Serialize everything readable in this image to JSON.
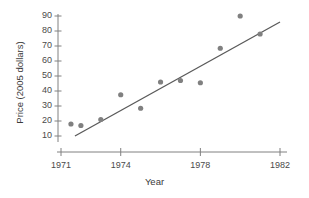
{
  "chart_data": {
    "type": "scatter",
    "title": "",
    "xlabel": "Year",
    "ylabel": "Price (2005 dollars)",
    "xlim": [
      1971,
      1982
    ],
    "ylim": [
      10,
      90
    ],
    "grid": false,
    "legend": false,
    "x_ticks": [
      1971,
      1974,
      1978,
      1982
    ],
    "x_tick_labels": [
      "1971",
      "1974",
      "1978",
      "1982"
    ],
    "y_ticks": [
      10,
      20,
      30,
      40,
      50,
      60,
      70,
      80,
      90
    ],
    "y_tick_labels": [
      "10",
      "20",
      "30",
      "40",
      "50",
      "60",
      "70",
      "80",
      "90"
    ],
    "marker_color": "#808080",
    "line_color": "#5a5a5a",
    "axis_color": "#808080",
    "points": [
      {
        "x": 1971.5,
        "y": 18
      },
      {
        "x": 1972.0,
        "y": 17
      },
      {
        "x": 1973.0,
        "y": 21
      },
      {
        "x": 1974.0,
        "y": 37.5
      },
      {
        "x": 1975.0,
        "y": 28.5
      },
      {
        "x": 1976.0,
        "y": 46
      },
      {
        "x": 1977.0,
        "y": 47
      },
      {
        "x": 1978.0,
        "y": 45.5
      },
      {
        "x": 1979.0,
        "y": 68.5
      },
      {
        "x": 1980.0,
        "y": 90
      },
      {
        "x": 1981.0,
        "y": 78
      }
    ],
    "trend_line": {
      "x_start": 1971.7,
      "y_start": 10,
      "x_end": 1982.0,
      "y_end": 86
    }
  }
}
